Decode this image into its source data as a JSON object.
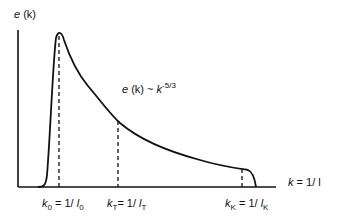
{
  "diagram": {
    "y_axis_label": {
      "var": "e",
      "arg": "(k)"
    },
    "x_axis_label": {
      "lhs": "k",
      "rhs": "= 1/ l"
    },
    "annotation": {
      "lhs": "e",
      "arg": "(k)",
      "sim": "~",
      "k": "k",
      "exponent": "-5/3"
    },
    "markers": [
      {
        "k": "k",
        "k_sub": "0",
        "eq": "= 1/",
        "l": "l",
        "l_sub": "0"
      },
      {
        "k": "k",
        "k_sub": "T",
        "eq": "= 1/",
        "l": "l",
        "l_sub": "T"
      },
      {
        "k": "k",
        "k_sub": "K",
        "eq": "= 1/",
        "l": "l",
        "l_sub": "K"
      }
    ],
    "line_color": "#111111"
  }
}
